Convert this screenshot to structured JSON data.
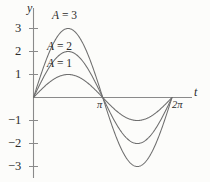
{
  "figure": {
    "background_color": "#fcfcfa",
    "curve_color": "#6e6e6e",
    "axis_color": "#8a8a8a",
    "text_color": "#2b2b2b"
  },
  "axes": {
    "y_axis_name": "y",
    "x_axis_name": "t",
    "y_tick_labels": [
      "3",
      "2",
      "1",
      "−1",
      "−2",
      "−3"
    ],
    "x_tick_labels": [
      "π",
      "2π"
    ]
  },
  "series_labels": [
    {
      "text": "A = 3",
      "var": "A",
      "eq": " = ",
      "num": "3"
    },
    {
      "text": "A = 2",
      "var": "A",
      "eq": " = ",
      "num": "2"
    },
    {
      "text": "A = 1",
      "var": "A",
      "eq": " = ",
      "num": "1"
    }
  ],
  "chart_data": {
    "type": "line",
    "title": "",
    "xlabel": "t",
    "ylabel": "y",
    "grid": false,
    "legend_position": "inline-annotation",
    "xlim": [
      0,
      6.283185307179586
    ],
    "ylim": [
      -3.4,
      3.4
    ],
    "xticks": [
      3.141592653589793,
      6.283185307179586
    ],
    "xticklabels": [
      "π",
      "2π"
    ],
    "yticks": [
      3,
      2,
      1,
      -1,
      -2,
      -3
    ],
    "yticklabels": [
      "3",
      "2",
      "1",
      "−1",
      "−2",
      "−3"
    ],
    "function": "y = A sin(t)",
    "series": [
      {
        "name": "A = 1",
        "amplitude": 1,
        "color": "#6e6e6e",
        "x": [
          0,
          0.3927,
          0.7854,
          1.1781,
          1.5708,
          1.9635,
          2.3562,
          2.7489,
          3.1416,
          3.5343,
          3.927,
          4.3197,
          4.7124,
          5.1051,
          5.4978,
          5.8905,
          6.2832
        ],
        "values": [
          0,
          0.383,
          0.707,
          0.924,
          1,
          0.924,
          0.707,
          0.383,
          0,
          -0.383,
          -0.707,
          -0.924,
          -1,
          -0.924,
          -0.707,
          -0.383,
          0
        ]
      },
      {
        "name": "A = 2",
        "amplitude": 2,
        "color": "#6e6e6e",
        "x": [
          0,
          0.3927,
          0.7854,
          1.1781,
          1.5708,
          1.9635,
          2.3562,
          2.7489,
          3.1416,
          3.5343,
          3.927,
          4.3197,
          4.7124,
          5.1051,
          5.4978,
          5.8905,
          6.2832
        ],
        "values": [
          0,
          0.765,
          1.414,
          1.848,
          2,
          1.848,
          1.414,
          0.765,
          0,
          -0.765,
          -1.414,
          -1.848,
          -2,
          -1.848,
          -1.414,
          -0.765,
          0
        ]
      },
      {
        "name": "A = 3",
        "amplitude": 3,
        "color": "#6e6e6e",
        "x": [
          0,
          0.3927,
          0.7854,
          1.1781,
          1.5708,
          1.9635,
          2.3562,
          2.7489,
          3.1416,
          3.5343,
          3.927,
          4.3197,
          4.7124,
          5.1051,
          5.4978,
          5.8905,
          6.2832
        ],
        "values": [
          0,
          1.148,
          2.121,
          2.772,
          3,
          2.772,
          2.121,
          1.148,
          0,
          -1.148,
          -2.121,
          -2.772,
          -3,
          -2.772,
          -2.121,
          -1.148,
          0
        ]
      }
    ]
  }
}
